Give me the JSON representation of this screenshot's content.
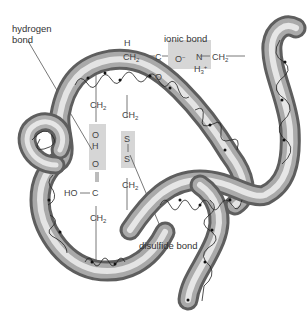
{
  "diagram": {
    "labels": {
      "hydrogen_bond": "hydrogen\nbond",
      "hydrogen_bond_line1": "hydrogen",
      "hydrogen_bond_line2": "bond",
      "ionic_bond": "ionic bond",
      "disulfide_bond": "disulfide bond"
    },
    "chemistry": {
      "top_H": "H",
      "top_CH2": "CH",
      "top_C": "C",
      "top_O_double": "O",
      "ionic_O": "O",
      "ionic_O_charge": "−",
      "ionic_N": "N",
      "ionic_H3": "H",
      "ionic_H3_sub": "3",
      "ionic_H3_charge": "+",
      "ionic_CH2": "CH",
      "hbond_CH2": "CH",
      "hbond_O": "O",
      "hbond_H": "H",
      "hbond_O2": "O",
      "hbond_HO": "HO",
      "hbond_C": "C",
      "hbond_CH2_low": "CH",
      "ss_CH2_top": "CH",
      "ss_S1": "S",
      "ss_S2": "S",
      "ss_CH2_bottom": "CH",
      "sub2": "2"
    },
    "colors": {
      "tube_dark": "#6e6e6e",
      "tube_light": "#f2f2f2",
      "highlight_box": "#d4d4d4",
      "line": "#555555"
    }
  }
}
